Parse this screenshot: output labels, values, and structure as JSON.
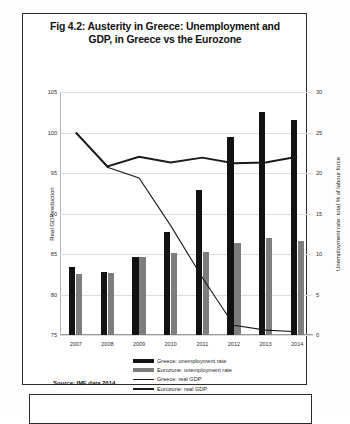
{
  "figure": {
    "title": "Fig 4.2: Austerity in Greece: Unemployment and GDP, in Greece vs the Eurozone",
    "source": "Source: IMF data 2014"
  },
  "legend": {
    "items": [
      {
        "label": "Greece: unemployment rate",
        "color": "#121212",
        "kind": "bar"
      },
      {
        "label": "Eurozone: unemployment rate",
        "color": "#7d7d7d",
        "kind": "bar"
      },
      {
        "label": "Greece: real GDP",
        "color": "#1a1a1a",
        "kind": "line"
      },
      {
        "label": "Eurozone: real GDP",
        "color": "#1a1a1a",
        "kind": "line"
      }
    ]
  },
  "chart_data": {
    "type": "bar",
    "title": "Fig 4.2: Austerity in Greece: Unemployment and GDP, in Greece vs the Eurozone",
    "xlabel": "",
    "ylabel": "Real GDP reduction",
    "y2label": "Unemployment rate: total % of labour force",
    "categories": [
      "2007",
      "2008",
      "2009",
      "2010",
      "2011",
      "2012",
      "2013",
      "2014"
    ],
    "ylim": [
      75,
      105
    ],
    "y2lim": [
      0,
      30
    ],
    "yticks": [
      75,
      80,
      85,
      90,
      95,
      100,
      105
    ],
    "y2ticks": [
      0,
      5,
      10,
      15,
      20,
      25,
      30
    ],
    "grid": true,
    "legend_position": "bottom",
    "series": [
      {
        "name": "Greece: unemployment rate",
        "axis": "y2",
        "chart": "bar",
        "color": "#121212",
        "values": [
          8.4,
          7.8,
          9.6,
          12.7,
          17.9,
          24.4,
          27.5,
          26.5
        ]
      },
      {
        "name": "Eurozone: unemployment rate",
        "axis": "y2",
        "chart": "bar",
        "color": "#7d7d7d",
        "values": [
          7.5,
          7.6,
          9.6,
          10.1,
          10.2,
          11.3,
          12.0,
          11.6
        ]
      },
      {
        "name": "Greece: real GDP",
        "axis": "y",
        "chart": "line",
        "color": "#1a1a1a",
        "values": [
          100.0,
          95.7,
          94.4,
          88.5,
          82.1,
          76.2,
          75.6,
          75.4
        ]
      },
      {
        "name": "Eurozone: real GDP",
        "axis": "y",
        "chart": "line",
        "color": "#1a1a1a",
        "values": [
          100.0,
          95.8,
          97.0,
          96.3,
          96.9,
          96.2,
          96.3,
          97.0
        ]
      }
    ]
  }
}
